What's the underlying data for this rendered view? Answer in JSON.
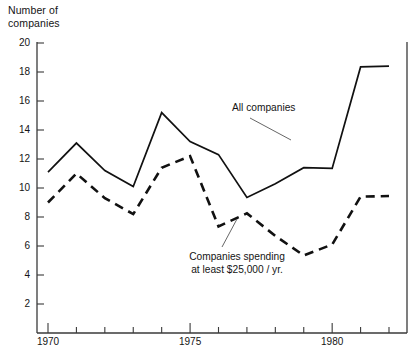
{
  "chart_data": {
    "type": "line",
    "title": "",
    "ylabel": "Number of\ncompanies",
    "xlabel": "",
    "xlim": [
      1970,
      1982
    ],
    "ylim": [
      0,
      20.6
    ],
    "grid": false,
    "legend_position": "inline-annotations",
    "x": [
      1970,
      1971,
      1972,
      1973,
      1974,
      1975,
      1976,
      1977,
      1978,
      1979,
      1980,
      1981,
      1982
    ],
    "yticks": [
      2,
      4,
      6,
      8,
      10,
      12,
      14,
      16,
      18,
      20
    ],
    "ytick_labels": [
      "2",
      "4",
      "6",
      "8",
      "10",
      "12",
      "14",
      "16",
      "18",
      "20"
    ],
    "xticks": [
      1970,
      1971,
      1972,
      1973,
      1974,
      1975,
      1976,
      1977,
      1978,
      1979,
      1980,
      1981,
      1982
    ],
    "xtick_labels": [
      "1970",
      "",
      "",
      "",
      "",
      "1975",
      "",
      "",
      "",
      "",
      "1980",
      "",
      ""
    ],
    "series": [
      {
        "name": "All companies",
        "style": "solid",
        "color": "#111111",
        "values": [
          11.1,
          13.1,
          11.2,
          10.1,
          15.2,
          13.2,
          12.3,
          9.35,
          10.3,
          11.4,
          11.35,
          18.35,
          18.4
        ]
      },
      {
        "name": "Companies spending at least $25,000 / yr.",
        "style": "dashed",
        "color": "#111111",
        "values": [
          9.0,
          11.0,
          9.3,
          8.2,
          11.4,
          12.2,
          7.35,
          8.25,
          6.7,
          5.35,
          6.1,
          9.4,
          9.45
        ]
      }
    ],
    "annotations": [
      {
        "id": "all-companies",
        "text": "All companies",
        "target_x": 1980,
        "target_y": 12.1
      },
      {
        "id": "companies-spending",
        "text": "Companies spending\nat least $25,000 / yr.",
        "target_x": 1977,
        "target_y": 8.25
      }
    ]
  },
  "axis": {
    "y_title_line1": "Number of",
    "y_title_line2": "companies"
  }
}
